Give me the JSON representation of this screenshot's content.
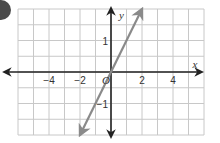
{
  "badge": {
    "color": "#4a4a4a"
  },
  "chart_data": {
    "type": "line",
    "title": "",
    "xlabel": "x",
    "ylabel": "y",
    "origin_label": "O",
    "xlim": [
      -6,
      6
    ],
    "ylim": [
      -2,
      2
    ],
    "grid": true,
    "x_ticks": [
      {
        "value": -4,
        "label": "−4"
      },
      {
        "value": -2,
        "label": "−2"
      },
      {
        "value": 2,
        "label": "2"
      },
      {
        "value": 4,
        "label": "4"
      }
    ],
    "y_ticks": [
      {
        "value": 1,
        "label": "1"
      },
      {
        "value": -1,
        "label": "−1"
      }
    ],
    "series": [
      {
        "name": "y = x",
        "equation": "y = x",
        "x": [
          -2,
          2
        ],
        "y": [
          -2,
          2
        ],
        "color": "#8a8a8a",
        "arrows": "both"
      }
    ],
    "colors": {
      "grid": "#c8c8c8",
      "axes": "#222222",
      "line": "#8a8a8a"
    }
  }
}
